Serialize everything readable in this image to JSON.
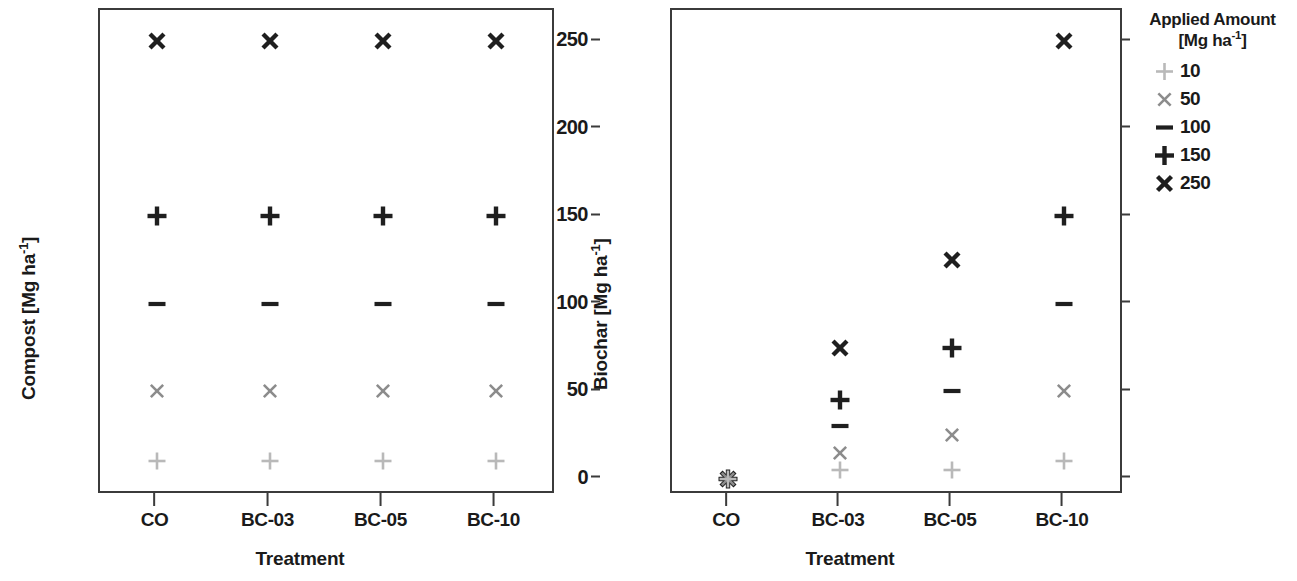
{
  "chart_data": [
    {
      "id": "compost-panel",
      "type": "scatter",
      "title": "",
      "xlabel": "Treatment",
      "ylabel": "Compost [Mg ha-1]",
      "ylabel_base": "Compost [Mg ha",
      "ylabel_sup": "-1",
      "ylabel_tail": "]",
      "categories": [
        "CO",
        "BC-03",
        "BC-05",
        "BC-10"
      ],
      "ytick_labels": [
        "0",
        "50",
        "100",
        "150",
        "200",
        "250"
      ],
      "ytick_values": [
        0,
        50,
        100,
        150,
        200,
        250
      ],
      "ylim": [
        -7,
        268
      ],
      "grid": false,
      "series": [
        {
          "name": "10",
          "marker": "plus-light",
          "values": [
            10,
            10,
            10,
            10
          ]
        },
        {
          "name": "50",
          "marker": "x-gray",
          "values": [
            50,
            50,
            50,
            50
          ]
        },
        {
          "name": "100",
          "marker": "dash-dark",
          "values": [
            100,
            100,
            100,
            100
          ]
        },
        {
          "name": "150",
          "marker": "plus-dark",
          "values": [
            150,
            150,
            150,
            150
          ]
        },
        {
          "name": "250",
          "marker": "x-dark",
          "values": [
            250,
            250,
            250,
            250
          ]
        }
      ]
    },
    {
      "id": "biochar-panel",
      "type": "scatter",
      "title": "",
      "xlabel": "Treatment",
      "ylabel": "Biochar [Mg ha-1]",
      "ylabel_base": "Biochar [Mg ha",
      "ylabel_sup": "-1",
      "ylabel_tail": "]",
      "categories": [
        "CO",
        "BC-03",
        "BC-05",
        "BC-10"
      ],
      "ytick_labels": [
        ",0",
        ",5",
        "1,0",
        "1,5",
        "2,0",
        "2,5"
      ],
      "ytick_values": [
        0,
        0.5,
        1.0,
        1.5,
        2.0,
        2.5
      ],
      "ylim": [
        -0.07,
        2.68
      ],
      "grid": false,
      "series": [
        {
          "name": "10",
          "marker": "plus-light",
          "values": [
            0,
            0.05,
            0.05,
            0.1
          ]
        },
        {
          "name": "50",
          "marker": "x-gray",
          "values": [
            0,
            0.15,
            0.25,
            0.5
          ]
        },
        {
          "name": "100",
          "marker": "dash-dark",
          "values": [
            0,
            0.3,
            0.5,
            1.0
          ]
        },
        {
          "name": "150",
          "marker": "plus-dark",
          "values": [
            0,
            0.45,
            0.75,
            1.5
          ]
        },
        {
          "name": "250",
          "marker": "x-dark",
          "values": [
            0,
            0.75,
            1.25,
            2.5
          ]
        }
      ]
    }
  ],
  "legend": {
    "title_line1": "Applied Amount",
    "title_line2_base": "[Mg ha",
    "title_line2_sup": "-1",
    "title_line2_tail": "]",
    "position": "right",
    "items": [
      {
        "label": "10",
        "marker": "plus-light"
      },
      {
        "label": "50",
        "marker": "x-gray"
      },
      {
        "label": "100",
        "marker": "dash-dark"
      },
      {
        "label": "150",
        "marker": "plus-dark"
      },
      {
        "label": "250",
        "marker": "x-dark"
      }
    ]
  },
  "colors": {
    "light_gray": "#b9b9b9",
    "mid_gray": "#8c8c8c",
    "dark": "#1f1f1f",
    "axis": "#3b3b3b",
    "background": "#ffffff"
  }
}
